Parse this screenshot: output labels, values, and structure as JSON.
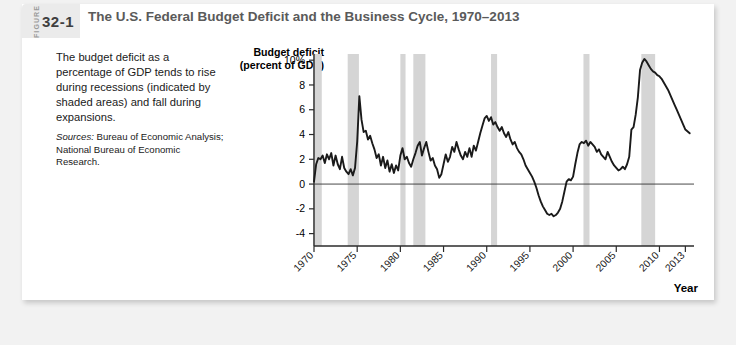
{
  "figure": {
    "word": "FIGURE",
    "number": "32-1",
    "title": "The U.S. Federal Budget Deficit and the Business Cycle, 1970–2013"
  },
  "caption": {
    "body": "The budget deficit as a percentage of GDP tends to rise during recessions (indicated by shaded areas) and fall during expansions.",
    "sources_label": "Sources:",
    "sources_text": " Bureau of Economic Analysis; National Bureau of Economic Research."
  },
  "colors": {
    "page_background": "#f2f2f2",
    "card_background": "#ffffff",
    "badge_background": "#ebebeb",
    "title_text": "#5a5a5a",
    "recession_band": "#d5d5d5",
    "data_line": "#1a1a1a",
    "axis": "#2b2b2b"
  },
  "chart_data": {
    "type": "line",
    "title": "The U.S. Federal Budget Deficit and the Business Cycle, 1970–2013",
    "xlabel": "Year",
    "ylabel": "Budget deficit (percent of GDP)",
    "ylabel_line1": "Budget deficit",
    "ylabel_line2": "(percent of GDP)",
    "xlim": [
      1970,
      2014
    ],
    "ylim": [
      -5,
      10.5
    ],
    "grid": false,
    "legend": null,
    "y_ticks": [
      {
        "value": 10,
        "label": "10%"
      },
      {
        "value": 8,
        "label": "8"
      },
      {
        "value": 6,
        "label": "6"
      },
      {
        "value": 4,
        "label": "4"
      },
      {
        "value": 2,
        "label": "2"
      },
      {
        "value": 0,
        "label": "0"
      },
      {
        "value": -2,
        "label": "-2"
      },
      {
        "value": -4,
        "label": "-4"
      }
    ],
    "x_ticks": [
      {
        "value": 1970,
        "label": "1970"
      },
      {
        "value": 1975,
        "label": "1975"
      },
      {
        "value": 1980,
        "label": "1980"
      },
      {
        "value": 1985,
        "label": "1985"
      },
      {
        "value": 1990,
        "label": "1990"
      },
      {
        "value": 1995,
        "label": "1995"
      },
      {
        "value": 2000,
        "label": "2000"
      },
      {
        "value": 2005,
        "label": "2005"
      },
      {
        "value": 2010,
        "label": "2010"
      },
      {
        "value": 2013,
        "label": "2013"
      }
    ],
    "zero_line": 0,
    "recession_bands": [
      {
        "start": 1969.9,
        "end": 1970.9
      },
      {
        "start": 1973.9,
        "end": 1975.2
      },
      {
        "start": 1980.0,
        "end": 1980.6
      },
      {
        "start": 1981.5,
        "end": 1982.9
      },
      {
        "start": 1990.5,
        "end": 1991.2
      },
      {
        "start": 2001.2,
        "end": 2001.9
      },
      {
        "start": 2007.9,
        "end": 2009.5
      }
    ],
    "series": [
      {
        "name": "Budget deficit (percent of GDP)",
        "x": [
          1970.0,
          1970.25,
          1970.5,
          1970.75,
          1971.0,
          1971.25,
          1971.5,
          1971.75,
          1972.0,
          1972.25,
          1972.5,
          1972.75,
          1973.0,
          1973.25,
          1973.5,
          1973.75,
          1974.0,
          1974.25,
          1974.5,
          1974.75,
          1975.0,
          1975.25,
          1975.5,
          1975.75,
          1976.0,
          1976.25,
          1976.5,
          1976.75,
          1977.0,
          1977.25,
          1977.5,
          1977.75,
          1978.0,
          1978.25,
          1978.5,
          1978.75,
          1979.0,
          1979.25,
          1979.5,
          1979.75,
          1980.0,
          1980.25,
          1980.5,
          1980.75,
          1981.0,
          1981.25,
          1981.5,
          1981.75,
          1982.0,
          1982.25,
          1982.5,
          1982.75,
          1983.0,
          1983.25,
          1983.5,
          1983.75,
          1984.0,
          1984.25,
          1984.5,
          1984.75,
          1985.0,
          1985.25,
          1985.5,
          1985.75,
          1986.0,
          1986.25,
          1986.5,
          1986.75,
          1987.0,
          1987.25,
          1987.5,
          1987.75,
          1988.0,
          1988.25,
          1988.5,
          1988.75,
          1989.0,
          1989.25,
          1989.5,
          1989.75,
          1990.0,
          1990.25,
          1990.5,
          1990.75,
          1991.0,
          1991.25,
          1991.5,
          1991.75,
          1992.0,
          1992.25,
          1992.5,
          1992.75,
          1993.0,
          1993.25,
          1993.5,
          1993.75,
          1994.0,
          1994.25,
          1994.5,
          1994.75,
          1995.0,
          1995.25,
          1995.5,
          1995.75,
          1996.0,
          1996.25,
          1996.5,
          1996.75,
          1997.0,
          1997.25,
          1997.5,
          1997.75,
          1998.0,
          1998.25,
          1998.5,
          1998.75,
          1999.0,
          1999.25,
          1999.5,
          1999.75,
          2000.0,
          2000.25,
          2000.5,
          2000.75,
          2001.0,
          2001.25,
          2001.5,
          2001.75,
          2002.0,
          2002.25,
          2002.5,
          2002.75,
          2003.0,
          2003.25,
          2003.5,
          2003.75,
          2004.0,
          2004.25,
          2004.5,
          2004.75,
          2005.0,
          2005.25,
          2005.5,
          2005.75,
          2006.0,
          2006.25,
          2006.5,
          2006.75,
          2007.0,
          2007.25,
          2007.5,
          2007.75,
          2008.0,
          2008.25,
          2008.5,
          2008.75,
          2009.0,
          2009.25,
          2009.5,
          2009.75,
          2010.0,
          2010.25,
          2010.5,
          2010.75,
          2011.0,
          2011.25,
          2011.5,
          2011.75,
          2012.0,
          2012.25,
          2012.5,
          2012.75,
          2013.0,
          2013.5
        ],
        "y": [
          0.2,
          1.6,
          2.1,
          2.0,
          2.3,
          1.7,
          2.4,
          2.0,
          2.5,
          1.5,
          2.3,
          1.6,
          1.2,
          2.2,
          1.3,
          1.0,
          0.8,
          1.2,
          0.7,
          1.3,
          3.4,
          7.1,
          5.2,
          4.2,
          4.3,
          3.6,
          3.9,
          3.3,
          2.8,
          2.1,
          2.4,
          1.5,
          2.2,
          1.3,
          1.9,
          1.0,
          1.6,
          0.9,
          1.5,
          1.1,
          2.3,
          2.9,
          2.0,
          2.2,
          1.7,
          1.4,
          2.0,
          2.5,
          3.1,
          3.4,
          2.3,
          2.9,
          3.4,
          2.6,
          1.9,
          2.1,
          1.5,
          1.2,
          0.5,
          0.8,
          1.6,
          2.4,
          1.8,
          2.2,
          3.0,
          2.6,
          3.4,
          2.8,
          2.3,
          2.0,
          2.6,
          2.2,
          2.9,
          2.2,
          3.1,
          2.7,
          3.4,
          4.1,
          4.7,
          5.3,
          5.5,
          5.1,
          5.4,
          4.8,
          5.0,
          4.6,
          4.3,
          4.6,
          4.1,
          3.8,
          4.2,
          3.6,
          3.2,
          3.4,
          2.9,
          2.6,
          2.4,
          2.0,
          1.5,
          1.2,
          0.9,
          0.6,
          0.2,
          -0.3,
          -0.9,
          -1.4,
          -1.8,
          -2.1,
          -2.4,
          -2.5,
          -2.4,
          -2.6,
          -2.5,
          -2.3,
          -2.0,
          -1.4,
          -0.6,
          0.2,
          0.4,
          0.3,
          0.6,
          1.6,
          2.5,
          3.2,
          3.4,
          3.3,
          3.5,
          3.1,
          3.4,
          3.2,
          3.0,
          2.6,
          2.8,
          2.4,
          2.2,
          2.0,
          2.6,
          2.2,
          1.8,
          1.5,
          1.3,
          1.1,
          1.2,
          1.4,
          1.2,
          1.6,
          2.2,
          4.4,
          4.6,
          5.6,
          7.0,
          9.2,
          9.8,
          10.1,
          9.9,
          9.6,
          9.3,
          9.1,
          9.0,
          8.8,
          8.7,
          8.5,
          8.2,
          7.9,
          7.6,
          7.2,
          6.8,
          6.4,
          6.0,
          5.6,
          5.2,
          4.8,
          4.4,
          4.1
        ]
      }
    ]
  }
}
